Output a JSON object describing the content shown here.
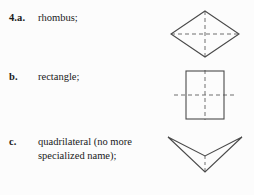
{
  "page": {
    "background_color": "#fcfcfc",
    "text_color": "#1a1a1a",
    "stroke_color": "#4a4a4a",
    "dash_color": "#6e6e6e"
  },
  "items": [
    {
      "label": "4.a.",
      "text": "rhombus;",
      "figure_name": "rhombus-figure",
      "figure": {
        "shape": "rhombus",
        "description": "rhombus with dashed diagonals shown as lines of symmetry",
        "dashed_lines": [
          "horizontal-diagonal",
          "vertical-diagonal"
        ]
      }
    },
    {
      "label": "b.",
      "text": "rectangle;",
      "figure_name": "rectangle-figure",
      "figure": {
        "shape": "rectangle",
        "description": "upright rectangle with dashed vertical and horizontal lines of symmetry",
        "dashed_lines": [
          "vertical-midline",
          "horizontal-midline"
        ]
      }
    },
    {
      "label": "c.",
      "text": "quadrilateral (no more\nspecialized name);",
      "figure_name": "dart-quadrilateral-figure",
      "figure": {
        "shape": "dart",
        "description": "concave arrowhead quadrilateral with dashed vertical segment",
        "dashed_lines": [
          "vertical-axis-segment"
        ]
      }
    }
  ]
}
